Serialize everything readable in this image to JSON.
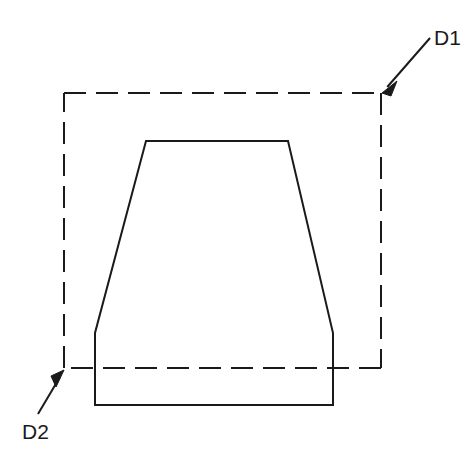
{
  "figure": {
    "background_color": "#ffffff",
    "line_color": "#1a1a1a",
    "width": 472,
    "height": 464
  },
  "shapes": {
    "dashed_boundary": {
      "name": "dashed-reference-box",
      "style": "dashed",
      "stroke_color": "#1a1a1a",
      "stroke_width": 2,
      "dash_pattern": "22 10",
      "x": 64,
      "y": 93,
      "width": 317,
      "height": 275,
      "corners": {
        "top_left": [
          64,
          93
        ],
        "top_right": [
          381,
          93
        ],
        "bottom_right": [
          381,
          368
        ],
        "bottom_left": [
          64,
          368
        ]
      }
    },
    "solid_outline": {
      "name": "trapezoid-profile",
      "style": "solid",
      "stroke_color": "#1a1a1a",
      "stroke_width": 2,
      "fill": "none",
      "points": [
        [
          146,
          141
        ],
        [
          288,
          141
        ],
        [
          333,
          333
        ],
        [
          333,
          405
        ],
        [
          95,
          405
        ],
        [
          95,
          333
        ]
      ],
      "description": "Closed polygon: flat top, two inward-sloping sides, short vertical sides, flat bottom"
    }
  },
  "callouts": [
    {
      "id": "d1",
      "label": "D1",
      "label_x": 434,
      "label_y": 45,
      "leader_start": [
        430,
        38
      ],
      "leader_end": [
        382,
        93
      ],
      "arrow_at": "leader_end",
      "points_to": "dashed-box-top-right-corner"
    },
    {
      "id": "d2",
      "label": "D2",
      "label_x": 22,
      "label_y": 439,
      "leader_start": [
        38,
        414
      ],
      "leader_end": [
        64,
        370
      ],
      "arrow_at": "leader_end",
      "points_to": "dashed-box-bottom-left-corner"
    }
  ]
}
